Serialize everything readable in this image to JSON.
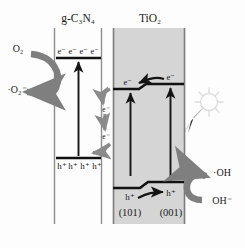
{
  "diagram": {
    "title_labels": {
      "left_material": "g-C₃N₄",
      "right_material": "TiO₂"
    },
    "left_semiconductor": {
      "name": "g-C3N4",
      "conduction_band_carriers": [
        "e⁻",
        "e⁻",
        "e⁻",
        "e⁻"
      ],
      "valence_band_carriers": [
        "h⁺",
        "h⁺",
        "h⁺",
        "h⁺"
      ]
    },
    "interface_transfer": {
      "cascade_carriers": [
        "e⁻",
        "e⁻"
      ]
    },
    "right_semiconductor": {
      "name": "TiO2",
      "conduction_band_carriers": [
        "e⁻",
        "e⁻"
      ],
      "valence_band_carriers": [
        "h⁺",
        "h⁺"
      ],
      "facets": [
        "(101)",
        "(001)"
      ]
    },
    "reactions": {
      "oxygen_reactant": "O₂",
      "superoxide_product": "·O₂⁻",
      "hydroxyl_radical_product": "·OH",
      "hydroxide_reactant": "OH⁻"
    },
    "light_source": {
      "icon": "sun-icon"
    },
    "colors": {
      "band_line": "#111111",
      "boundary_line": "#8d8d8d",
      "tio2_fill": "#d5d5d5",
      "gray_arrow": "#7f7f7f",
      "black_arrow": "#141414",
      "text": "#1a1a1a",
      "sun_outline": "#dcdcdc",
      "light_wedge": "#2a2a2a",
      "background": "#fdfdfd"
    }
  }
}
